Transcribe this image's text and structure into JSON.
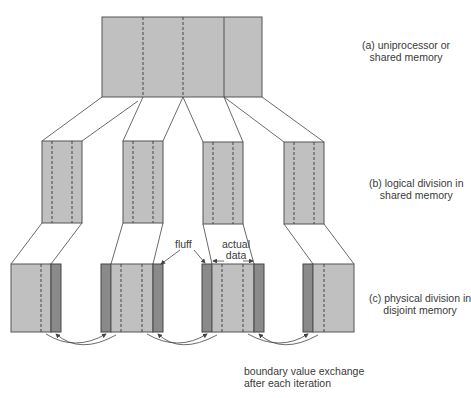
{
  "colors": {
    "data_fill": "#c0c0c0",
    "fluff_fill": "#8a8a8a",
    "stroke": "#444444",
    "background": "#ffffff"
  },
  "labels": {
    "a_line1": "(a) uniprocessor or",
    "a_line2": "shared memory",
    "b_line1": "(b) logical division in",
    "b_line2": "shared memory",
    "c_line1": "(c) physical division in",
    "c_line2": "disjoint memory",
    "fluff": "fluff",
    "actual_line1": "actual",
    "actual_line2": "data",
    "exchange_line1": "boundary value exchange",
    "exchange_line2": "after each iteration"
  },
  "diagram": {
    "top_block": {
      "x": 102,
      "y": 17,
      "w": 160,
      "h": 80,
      "dashed_dividers": [
        143,
        183
      ],
      "solid_divider": 224
    },
    "middle_blocks": [
      {
        "x": 42,
        "y": 141,
        "w": 40,
        "h": 82
      },
      {
        "x": 123,
        "y": 141,
        "w": 40,
        "h": 82
      },
      {
        "x": 203,
        "y": 142,
        "w": 40,
        "h": 82
      },
      {
        "x": 284,
        "y": 142,
        "w": 40,
        "h": 82
      }
    ],
    "bottom_blocks": [
      {
        "x": 11,
        "y": 264,
        "w": 50,
        "h": 68,
        "fluff_left": false,
        "fluff_right": true
      },
      {
        "x": 101,
        "y": 264,
        "w": 62,
        "h": 68,
        "fluff_left": true,
        "fluff_right": true
      },
      {
        "x": 202,
        "y": 264,
        "w": 62,
        "h": 68,
        "fluff_left": true,
        "fluff_right": true
      },
      {
        "x": 303,
        "y": 264,
        "w": 51,
        "h": 68,
        "fluff_left": true,
        "fluff_right": false
      }
    ]
  }
}
